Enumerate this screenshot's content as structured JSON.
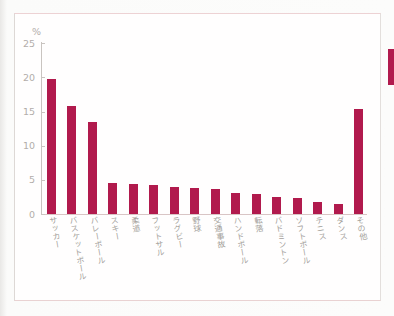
{
  "chart_data": {
    "type": "bar",
    "title": "",
    "xlabel": "",
    "ylabel": "%",
    "ylim": [
      0,
      25
    ],
    "yticks": [
      25,
      20,
      15,
      10,
      5,
      0
    ],
    "grid": false,
    "legend": "none",
    "bar_color": "#b11a4d",
    "categories": [
      "サッカー",
      "バスケットボール",
      "バレーボール",
      "スキー",
      "柔道",
      "フットサル",
      "ラグビー",
      "野球",
      "交通事故",
      "ハンドボール",
      "転落",
      "バドミントン",
      "ソフトボール",
      "テニス",
      "ダンス",
      "その他"
    ],
    "values": [
      19.8,
      15.8,
      13.4,
      4.5,
      4.4,
      4.3,
      4.0,
      3.8,
      3.7,
      3.1,
      3.0,
      2.5,
      2.4,
      1.7,
      1.5,
      15.4
    ]
  },
  "decorations": {
    "page_edge_tab_color": "#b11a4d"
  }
}
